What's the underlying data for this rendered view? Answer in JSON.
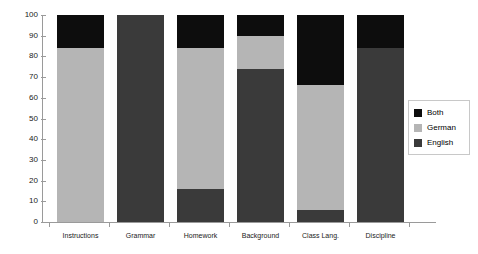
{
  "chart_data": {
    "type": "bar",
    "title": "",
    "subtitle": "",
    "xlabel": "",
    "ylabel": "",
    "stacked": true,
    "stack_mode": "percent",
    "grid": false,
    "legend_position": "right",
    "ylim": [
      0,
      100
    ],
    "y_ticks": [
      0,
      10,
      20,
      30,
      40,
      50,
      60,
      70,
      80,
      90,
      100
    ],
    "y_tick_labels": [
      "0",
      "10",
      "20",
      "30",
      "40",
      "50",
      "60",
      "70",
      "80",
      "90",
      "100"
    ],
    "categories": [
      "Instructions",
      "Grammar",
      "Homework",
      "Background",
      "Class Lang.",
      "Discipline"
    ],
    "series": [
      {
        "name": "Both",
        "color": "#0d0d0d",
        "values": [
          16,
          0,
          16,
          10,
          34,
          16
        ]
      },
      {
        "name": "German",
        "color": "#b5b5b5",
        "values": [
          84,
          0,
          68,
          16,
          60,
          0
        ]
      },
      {
        "name": "English",
        "color": "#3a3a3a",
        "values": [
          0,
          100,
          16,
          74,
          6,
          84
        ]
      }
    ],
    "stack_boundaries": {
      "note": "cumulative tops read off the axis, bottom-to-top order English, German, Both",
      "Instructions": {
        "English": 0,
        "German": 84,
        "Both": 100
      },
      "Grammar": {
        "English": 100,
        "German": 100,
        "Both": 100
      },
      "Homework": {
        "English": 16,
        "German": 84,
        "Both": 100
      },
      "Background": {
        "English": 74,
        "German": 90,
        "Both": 100
      },
      "Class Lang.": {
        "English": 6,
        "German": 66,
        "Both": 100
      },
      "Discipline": {
        "English": 84,
        "German": 84,
        "Both": 100
      }
    }
  },
  "legend": {
    "entries": [
      {
        "label": "Both",
        "color": "#0d0d0d"
      },
      {
        "label": "German",
        "color": "#b5b5b5"
      },
      {
        "label": "English",
        "color": "#3a3a3a"
      }
    ]
  },
  "axis": {
    "y_axis_name": "percent-axis",
    "x_axis_name": "category-axis"
  }
}
